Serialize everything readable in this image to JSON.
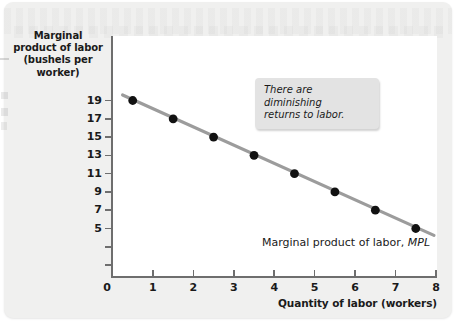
{
  "chart_data": {
    "type": "scatter",
    "title": "",
    "ylabel": "Marginal product of labor (bushels per worker)",
    "xlabel": "Quantity of labor (workers)",
    "x": [
      0.5,
      1.5,
      2.5,
      3.5,
      4.5,
      5.5,
      6.5,
      7.5
    ],
    "values": [
      19,
      17,
      15,
      13,
      11,
      9,
      7,
      5
    ],
    "series": [
      {
        "name": "Marginal product of labor, MPL",
        "x": [
          0.5,
          1.5,
          2.5,
          3.5,
          4.5,
          5.5,
          6.5,
          7.5
        ],
        "values": [
          19,
          17,
          15,
          13,
          11,
          9,
          7,
          5
        ]
      }
    ],
    "xlim": [
      0,
      8
    ],
    "ylim": [
      0,
      20
    ],
    "xticks": [
      0,
      1,
      2,
      3,
      4,
      5,
      6,
      7,
      8
    ],
    "yticks": [
      5,
      7,
      9,
      11,
      13,
      15,
      17,
      19
    ],
    "grid": false,
    "legend_position": "none",
    "trendline": {
      "from": [
        0.25,
        19.6
      ],
      "to": [
        7.95,
        4.25
      ],
      "color": "#9c9c9c"
    },
    "annotations": [
      {
        "text": "There are diminishing returns to labor.",
        "style": "italic-callout"
      },
      {
        "text": "Marginal product of labor, MPL",
        "style": "series-label"
      }
    ]
  },
  "axes": {
    "y_title_lines": [
      "Marginal",
      "product of labor",
      "(bushels per",
      "worker)"
    ],
    "y_tick_labels": [
      "19",
      "17",
      "15",
      "13",
      "11",
      "9",
      "7",
      "5"
    ],
    "x_tick_labels": [
      "1",
      "2",
      "3",
      "4",
      "5",
      "6",
      "7",
      "8"
    ],
    "origin_label": "0",
    "x_title": "Quantity of labor (workers)"
  },
  "callout": {
    "line1": "There are diminishing",
    "line2": "returns to labor."
  },
  "series_label": {
    "text": "Marginal product of labor,",
    "symbol": "MPL"
  },
  "colors": {
    "point": "#111111",
    "line": "#9c9c9c",
    "axis": "#6e6e6e",
    "plot_background": "#ffffff",
    "card_background": "#f0f0ef",
    "callout_background": "#e3e3e3",
    "text": "#1a1a1a"
  }
}
